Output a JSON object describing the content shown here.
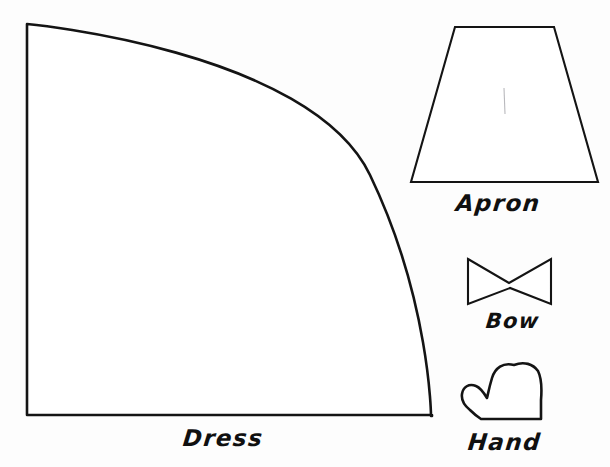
{
  "sheet": {
    "title": "Doll Clothing Pattern Template Sheet",
    "background_color": "#fdfdfd",
    "ink_color": "#141414",
    "width": 610,
    "height": 467
  },
  "pieces": [
    {
      "id": "dress",
      "label": "Dress",
      "shape": "quarter-circle",
      "description": "Large quarter circle with straight left and bottom edges and a curved arc from upper-left to lower-right",
      "outline_path": "M 27 24 L 27 415 L 432 415 L 432 416 L 431 416 C 431 416 430 300 370 175 C 310 50 27 24 27 24 Z",
      "bounds": {
        "x": 22,
        "y": 24,
        "width": 410,
        "height": 392
      },
      "label_position": {
        "x": 183,
        "y": 425
      }
    },
    {
      "id": "apron",
      "label": "Apron",
      "shape": "trapezoid",
      "description": "Isosceles trapezoid, narrow top edge and wide bottom edge",
      "outline_path": "M 455 27 L 554 27 L 598 182 L 411 182 Z",
      "bounds": {
        "x": 411,
        "y": 27,
        "width": 187,
        "height": 155
      },
      "fold_mark_path": "M 504 88 L 505 114",
      "label_position": {
        "x": 456,
        "y": 190
      }
    },
    {
      "id": "bow",
      "label": "Bow",
      "shape": "bowtie",
      "description": "Bow tie shape, two triangles meeting at a pinched center",
      "outline_path": "M 468 259 L 509 283 L 551 259 L 551 304 L 510 288 L 468 304 Z",
      "bounds": {
        "x": 468,
        "y": 259,
        "width": 83,
        "height": 45
      },
      "label_position": {
        "x": 486,
        "y": 309
      }
    },
    {
      "id": "hand",
      "label": "Hand",
      "shape": "mitten",
      "description": "Mitten shaped hand with thumb on the left side and flat wrist edge at the bottom",
      "outline_path": "M 514 365 C 503 362 495 368 492 378 C 489 388 488 394 487 398 C 484 393 481 388 476 386 C 469 383 463 387 462 394 C 461 401 465 406 470 410 C 474 414 478 417 481 419 L 541 419 L 541 400 C 542 388 541 377 538 371 C 533 364 524 361 514 365 Z",
      "bounds": {
        "x": 461,
        "y": 361,
        "width": 81,
        "height": 59
      },
      "label_position": {
        "x": 468,
        "y": 429
      }
    }
  ]
}
